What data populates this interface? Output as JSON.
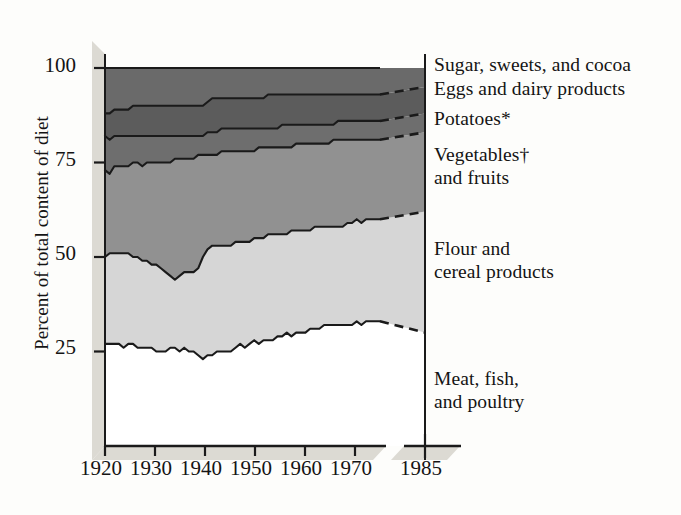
{
  "figure": {
    "type": "stacked-area",
    "axis_y_title": "Percent of total content of diet",
    "axis_break_note": "axis break between 1970s data and 1985 projection"
  },
  "chart_data": {
    "type": "area",
    "stacked": true,
    "title": "",
    "xlabel": "",
    "ylabel": "Percent of total content of diet",
    "xlim": [
      1920,
      1985
    ],
    "ylim": [
      0,
      100
    ],
    "grid": false,
    "legend_position": "right",
    "y_ticks": [
      "25",
      "50",
      "75",
      "100"
    ],
    "y_tick_values": [
      25,
      50,
      75,
      100
    ],
    "x_ticks": [
      "1920",
      "1930",
      "1940",
      "1950",
      "1960",
      "1970",
      "1985"
    ],
    "x_tick_values": [
      1920,
      1930,
      1940,
      1950,
      1960,
      1970,
      1985
    ],
    "x_data_end": 1978,
    "x_projection_end": 1985,
    "series": [
      {
        "name": "Meat, fish, and poultry",
        "order": 1,
        "fill": "#ffffff",
        "legend_label_lines": [
          "Meat, fish,",
          "and poultry"
        ],
        "cumulative_top": [
          27,
          27,
          27,
          27,
          26,
          27,
          27,
          26,
          26,
          26,
          26,
          25,
          25,
          25,
          26,
          26,
          25,
          26,
          25,
          25,
          24,
          23,
          24,
          24,
          25,
          25,
          25,
          25,
          26,
          27,
          26,
          27,
          28,
          27,
          28,
          28,
          28,
          29,
          29,
          30,
          29,
          30,
          30,
          30,
          31,
          31,
          31,
          32,
          32,
          32,
          32,
          32,
          32,
          32,
          33,
          32,
          33,
          33,
          33,
          33
        ],
        "projection_top": [
          33,
          30
        ]
      },
      {
        "name": "Flour and cereal products",
        "order": 2,
        "fill": "#d6d6d6",
        "legend_label_lines": [
          "Flour and",
          "cereal products"
        ],
        "cumulative_top": [
          50,
          51,
          51,
          51,
          51,
          51,
          50,
          50,
          49,
          49,
          48,
          48,
          47,
          46,
          45,
          44,
          45,
          46,
          46,
          46,
          47,
          50,
          52,
          53,
          53,
          53,
          53,
          53,
          54,
          54,
          54,
          54,
          55,
          55,
          55,
          56,
          56,
          56,
          56,
          56,
          57,
          57,
          57,
          57,
          57,
          58,
          58,
          58,
          58,
          58,
          58,
          58,
          59,
          59,
          60,
          59,
          60,
          60,
          60,
          60
        ],
        "projection_top": [
          60,
          62
        ]
      },
      {
        "name": "Vegetables and fruits",
        "order": 3,
        "fill": "#919191",
        "legend_label_lines": [
          "Vegetables†",
          "and fruits"
        ],
        "cumulative_top": [
          73,
          72,
          74,
          74,
          74,
          74,
          75,
          75,
          74,
          75,
          75,
          75,
          75,
          75,
          75,
          76,
          76,
          76,
          76,
          76,
          77,
          77,
          77,
          77,
          77,
          78,
          78,
          78,
          78,
          78,
          78,
          78,
          78,
          79,
          79,
          79,
          79,
          79,
          79,
          79,
          79,
          80,
          80,
          80,
          80,
          80,
          80,
          80,
          80,
          81,
          81,
          81,
          81,
          81,
          81,
          81,
          81,
          81,
          81,
          81
        ],
        "projection_top": [
          81,
          83
        ]
      },
      {
        "name": "Potatoes",
        "order": 4,
        "fill": "#6e6e6e",
        "legend_label_lines": [
          "Potatoes*"
        ],
        "cumulative_top": [
          82,
          81,
          82,
          82,
          82,
          82,
          82,
          82,
          82,
          82,
          82,
          82,
          82,
          82,
          82,
          82,
          82,
          82,
          82,
          82,
          82,
          82,
          83,
          83,
          83,
          84,
          84,
          84,
          84,
          84,
          84,
          84,
          84,
          84,
          84,
          84,
          84,
          84,
          85,
          85,
          85,
          85,
          85,
          85,
          85,
          85,
          85,
          85,
          85,
          85,
          86,
          86,
          86,
          86,
          86,
          86,
          86,
          86,
          86,
          86
        ],
        "projection_top": [
          86,
          88
        ]
      },
      {
        "name": "Eggs and dairy products",
        "order": 5,
        "fill": "#5c5c5c",
        "legend_label_lines": [
          "Eggs and dairy products"
        ],
        "cumulative_top": [
          88,
          88,
          89,
          89,
          89,
          89,
          90,
          90,
          90,
          90,
          90,
          90,
          90,
          90,
          90,
          90,
          90,
          90,
          90,
          90,
          90,
          90,
          91,
          92,
          92,
          92,
          92,
          92,
          92,
          92,
          92,
          92,
          92,
          92,
          92,
          93,
          93,
          93,
          93,
          93,
          93,
          93,
          93,
          93,
          93,
          93,
          93,
          93,
          93,
          93,
          93,
          93,
          93,
          93,
          93,
          93,
          93,
          93,
          93,
          93
        ],
        "projection_top": [
          93,
          95
        ]
      },
      {
        "name": "Sugar, sweets, and cocoa",
        "order": 6,
        "fill": "#6a6a6a",
        "legend_label_lines": [
          "Sugar, sweets, and cocoa"
        ],
        "cumulative_top": [
          100,
          100,
          100,
          100,
          100,
          100,
          100,
          100,
          100,
          100,
          100,
          100,
          100,
          100,
          100,
          100,
          100,
          100,
          100,
          100,
          100,
          100,
          100,
          100,
          100,
          100,
          100,
          100,
          100,
          100,
          100,
          100,
          100,
          100,
          100,
          100,
          100,
          100,
          100,
          100,
          100,
          100,
          100,
          100,
          100,
          100,
          100,
          100,
          100,
          100,
          100,
          100,
          100,
          100,
          100,
          100,
          100,
          100,
          100,
          100
        ],
        "projection_top": [
          100,
          100
        ]
      }
    ]
  },
  "legend": {
    "entries": [
      {
        "label": "Sugar, sweets, and cocoa"
      },
      {
        "label": "Eggs and dairy products"
      },
      {
        "label": "Potatoes*"
      },
      {
        "label": "Vegetables†"
      },
      {
        "label": "and fruits"
      },
      {
        "label": "Flour and"
      },
      {
        "label": "cereal products"
      },
      {
        "label": "Meat, fish,"
      },
      {
        "label": "and poultry"
      }
    ]
  },
  "colors": {
    "sugar": "#6a6a6a",
    "eggs": "#5c5c5c",
    "potatoes": "#6e6e6e",
    "vegetables": "#919191",
    "flour": "#d6d6d6",
    "meat": "#ffffff",
    "axis": "#1a1a1a",
    "shadow": "#dcdad3",
    "background": "#fdfdfb"
  }
}
